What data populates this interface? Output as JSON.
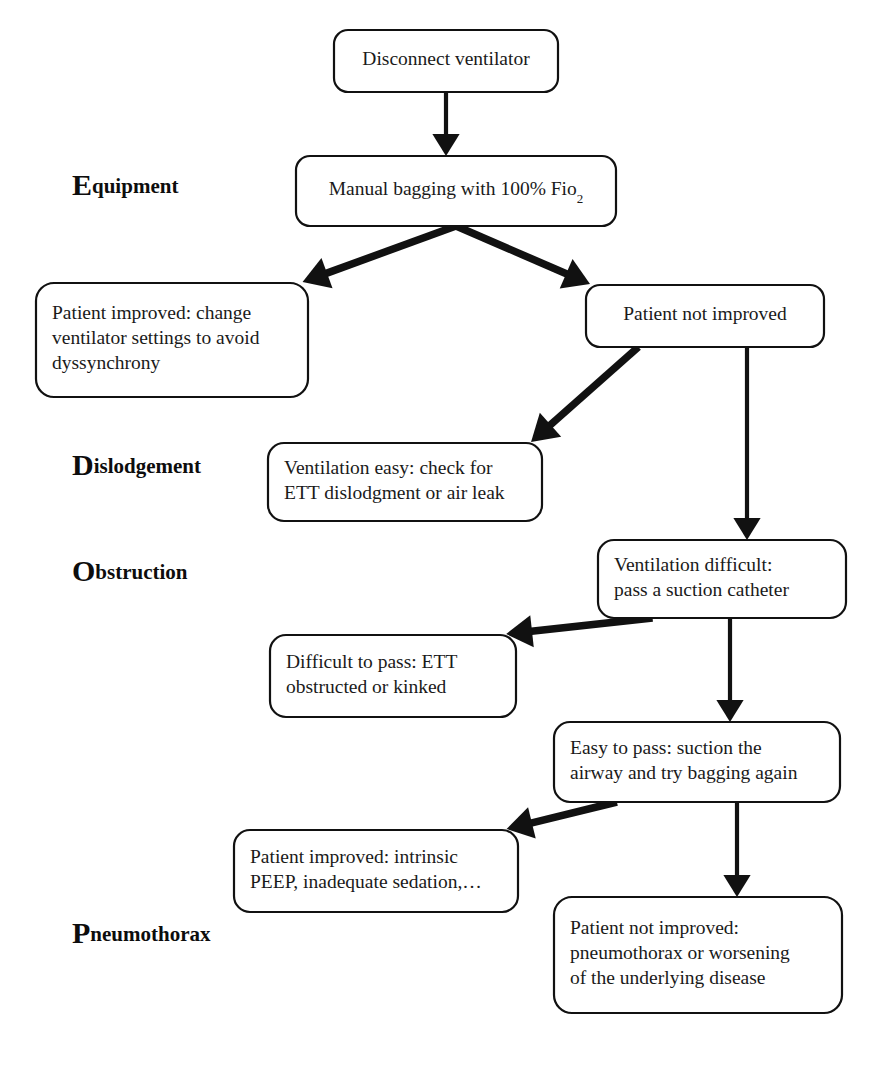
{
  "document": {
    "title": "DOPE Ventilator Troubleshooting Flowchart",
    "background_color": "#ffffff",
    "line_color": "#111111",
    "text_color": "#1a1a1a"
  },
  "stage_labels": [
    {
      "id": "equipment",
      "cap": "E",
      "rest": "quipment",
      "x": 72,
      "y": 188
    },
    {
      "id": "dislodgement",
      "cap": "D",
      "rest": "islodgement",
      "x": 72,
      "y": 468
    },
    {
      "id": "obstruction",
      "cap": "O",
      "rest": "bstruction",
      "x": 72,
      "y": 574
    },
    {
      "id": "pneumothorax",
      "cap": "P",
      "rest": "neumothorax",
      "x": 72,
      "y": 936
    }
  ],
  "nodes": [
    {
      "id": "disconnect-ventilator",
      "lines": [
        "Disconnect ventilator"
      ],
      "x": 334,
      "y": 30,
      "w": 224,
      "h": 62,
      "r": 14,
      "align": "center"
    },
    {
      "id": "manual-bagging",
      "lines": [
        "Manual bagging with 100% Fio",
        "2"
      ],
      "text_html": "Manual bagging with 100% Fio<sub>2</sub>",
      "x": 296,
      "y": 156,
      "w": 320,
      "h": 70,
      "r": 14,
      "align": "center",
      "subscript": "2"
    },
    {
      "id": "patient-improved-change-settings",
      "lines": [
        "Patient improved: change",
        "ventilator settings to avoid",
        "dyssynchrony"
      ],
      "x": 36,
      "y": 283,
      "w": 272,
      "h": 114,
      "r": 18,
      "align": "left"
    },
    {
      "id": "patient-not-improved",
      "lines": [
        "Patient not improved"
      ],
      "x": 586,
      "y": 285,
      "w": 238,
      "h": 62,
      "r": 14,
      "align": "center"
    },
    {
      "id": "ventilation-easy",
      "lines": [
        "Ventilation easy: check for",
        "ETT dislodgment or air leak"
      ],
      "x": 268,
      "y": 443,
      "w": 274,
      "h": 78,
      "r": 16,
      "align": "left"
    },
    {
      "id": "ventilation-difficult",
      "lines": [
        "Ventilation difficult:",
        "pass a suction catheter"
      ],
      "x": 598,
      "y": 540,
      "w": 248,
      "h": 78,
      "r": 16,
      "align": "left"
    },
    {
      "id": "difficult-to-pass",
      "lines": [
        "Difficult to pass: ETT",
        "obstructed or kinked"
      ],
      "x": 270,
      "y": 635,
      "w": 246,
      "h": 82,
      "r": 16,
      "align": "left"
    },
    {
      "id": "easy-to-pass",
      "lines": [
        "Easy to pass: suction the",
        "airway and try bagging again"
      ],
      "x": 554,
      "y": 722,
      "w": 286,
      "h": 80,
      "r": 16,
      "align": "left"
    },
    {
      "id": "patient-improved-intrinsic-peep",
      "lines": [
        "Patient improved: intrinsic",
        "PEEP, inadequate sedation,…"
      ],
      "x": 234,
      "y": 830,
      "w": 284,
      "h": 82,
      "r": 16,
      "align": "left"
    },
    {
      "id": "patient-not-improved-pneumothorax",
      "lines": [
        "Patient not improved:",
        "pneumothorax or worsening",
        "of the underlying disease"
      ],
      "x": 554,
      "y": 897,
      "w": 288,
      "h": 116,
      "r": 18,
      "align": "left"
    }
  ],
  "edges": [
    {
      "id": "edge-disconnect-to-bagging",
      "from": "disconnect-ventilator",
      "to": "manual-bagging",
      "style": "thin",
      "kind": "vertical"
    },
    {
      "id": "edge-bagging-to-improved",
      "from": "manual-bagging",
      "to": "patient-improved-change-settings",
      "style": "thick",
      "kind": "diagonal-left"
    },
    {
      "id": "edge-bagging-to-not-improved",
      "from": "manual-bagging",
      "to": "patient-not-improved",
      "style": "thick",
      "kind": "diagonal-right"
    },
    {
      "id": "edge-not-improved-to-vent-easy",
      "from": "patient-not-improved",
      "to": "ventilation-easy",
      "style": "thick",
      "kind": "diagonal-left"
    },
    {
      "id": "edge-not-improved-to-vent-difficult",
      "from": "patient-not-improved",
      "to": "ventilation-difficult",
      "style": "thin",
      "kind": "vertical"
    },
    {
      "id": "edge-vent-difficult-to-difficult-pass",
      "from": "ventilation-difficult",
      "to": "difficult-to-pass",
      "style": "thick",
      "kind": "diagonal-left"
    },
    {
      "id": "edge-vent-difficult-to-easy-pass",
      "from": "ventilation-difficult",
      "to": "easy-to-pass",
      "style": "thin",
      "kind": "vertical"
    },
    {
      "id": "edge-easy-pass-to-improved-peep",
      "from": "easy-to-pass",
      "to": "patient-improved-intrinsic-peep",
      "style": "thick",
      "kind": "diagonal-left"
    },
    {
      "id": "edge-easy-pass-to-not-improved-pneumo",
      "from": "easy-to-pass",
      "to": "patient-not-improved-pneumothorax",
      "style": "thin",
      "kind": "vertical"
    }
  ],
  "footer": {
    "ghost_caption": ""
  }
}
